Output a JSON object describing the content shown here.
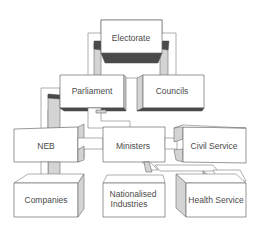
{
  "diagram": {
    "type": "3d-block-hierarchy",
    "nodes": {
      "electorate": "Electorate",
      "parliament": "Parliament",
      "councils": "Councils",
      "neb": "NEB",
      "ministers": "Ministers",
      "civil_service": "Civil Service",
      "companies": "Companies",
      "nationalised_industries_1": "Nationalised",
      "nationalised_industries_2": "Industries",
      "health_service": "Health Service"
    },
    "edges": [
      [
        "Electorate",
        "Parliament"
      ],
      [
        "Electorate",
        "Councils"
      ],
      [
        "Parliament",
        "Ministers"
      ],
      [
        "Parliament",
        "NEB"
      ],
      [
        "Ministers",
        "NEB"
      ],
      [
        "Ministers",
        "Civil Service"
      ],
      [
        "Ministers",
        "Nationalised Industries"
      ],
      [
        "Ministers",
        "Health Service"
      ],
      [
        "NEB",
        "Companies"
      ]
    ],
    "colors": {
      "face": "#ffffff",
      "side": "#d4d4d4",
      "shadow": "#4a4a4a",
      "stroke": "#6a6a6a",
      "text": "#4a4a4a"
    }
  }
}
